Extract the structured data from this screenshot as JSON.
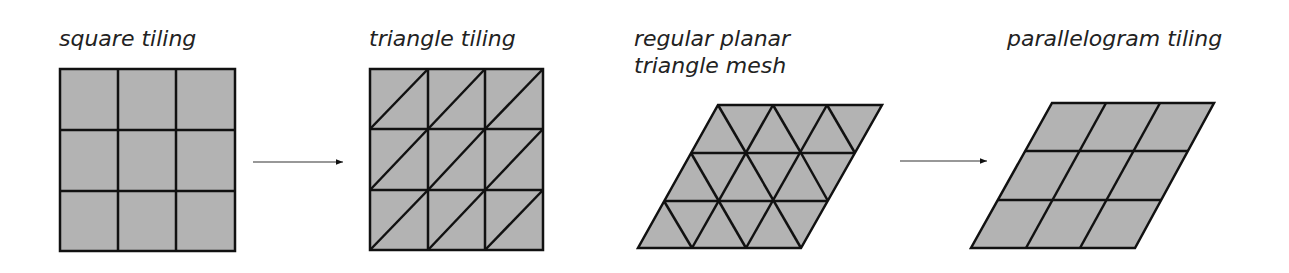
{
  "colors": {
    "fill": "#b3b3b3",
    "stroke": "#111111",
    "arrow": "#111111"
  },
  "panels": [
    {
      "id": "square",
      "title_lines": [
        "square tiling"
      ]
    },
    {
      "id": "triangle",
      "title_lines": [
        "triangle tiling"
      ]
    },
    {
      "id": "mesh",
      "title_lines": [
        "regular planar",
        "triangle mesh"
      ]
    },
    {
      "id": "parallelogram",
      "title_lines": [
        "parallelogram tiling"
      ]
    }
  ],
  "arrows": [
    {
      "from": "square tiling",
      "to": "triangle tiling"
    },
    {
      "from": "regular planar triangle mesh",
      "to": "parallelogram tiling"
    }
  ],
  "grid": {
    "rows": 3,
    "cols": 3
  }
}
